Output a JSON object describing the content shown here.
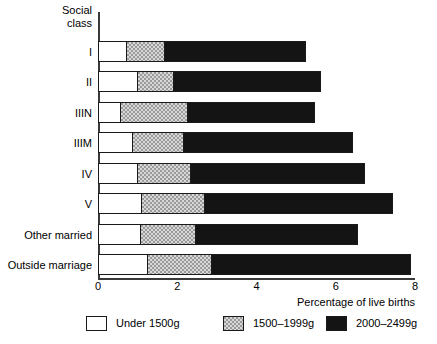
{
  "chart_data": {
    "type": "bar",
    "orientation": "horizontal",
    "stacked": true,
    "title": "",
    "xlabel": "Percentage of live births",
    "ylabel": "Social\nclass",
    "xlim": [
      0,
      8
    ],
    "xticks": [
      "0",
      "2",
      "4",
      "6",
      "8"
    ],
    "xtick_values": [
      0,
      2,
      4,
      6,
      8
    ],
    "grid": false,
    "legend_position": "bottom",
    "categories": [
      "I",
      "II",
      "IIIN",
      "IIIM",
      "IV",
      "V",
      "Other married",
      "Outside marriage"
    ],
    "series": [
      {
        "name": "Under 1500g",
        "color": "#ffffff",
        "values": [
          0.73,
          1.01,
          0.58,
          0.89,
          1.01,
          1.11,
          1.09,
          1.27
        ]
      },
      {
        "name": "1500–1999g",
        "color": "#9a9a9a",
        "values": [
          0.97,
          0.91,
          1.7,
          1.29,
          1.34,
          1.6,
          1.39,
          1.62
        ]
      },
      {
        "name": "2000–2499g",
        "color": "#141414",
        "values": [
          3.54,
          3.7,
          3.19,
          4.25,
          4.38,
          4.73,
          4.08,
          5.01
        ]
      }
    ],
    "totals": [
      5.24,
      5.62,
      5.47,
      6.43,
      6.73,
      7.44,
      6.56,
      7.9
    ]
  }
}
